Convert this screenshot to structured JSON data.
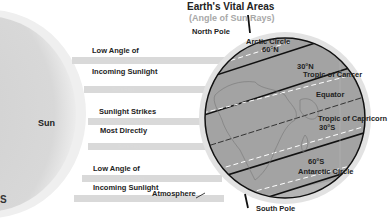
{
  "header": {
    "title": "Earth's Vital Areas",
    "subtitle": "(Angle of Sun Rays)"
  },
  "sun": {
    "label": "Sun",
    "color": "#d4d4d4"
  },
  "rays": {
    "ray_label": "Sun's Rays",
    "color": "#d9d9d9"
  },
  "left_labels": {
    "top_line1": "Low Angle of",
    "top_line2": "Incoming Sunlight",
    "mid_line1": "Sunlight Strikes",
    "mid_line2": "Most Directly",
    "bottom_line1": "Low Angle of",
    "bottom_line2": "Incoming Sunlight"
  },
  "earth_labels": {
    "north_pole": "North Pole",
    "arctic_circle": "Arctic Circle",
    "lat_60n": "60°N",
    "lat_30n": "30°N",
    "tropic_cancer": "Tropic of Cancer",
    "equator": "Equator",
    "tropic_capricorn": "Tropic of Capricorn",
    "lat_30s": "30°S",
    "lat_60s": "60°S",
    "antarctic_circle": "Antarctic Circle",
    "atmosphere": "Atmosphere",
    "south_pole": "South Pole"
  },
  "edge_fragment": "S",
  "colors": {
    "earth": "#a3a3a3",
    "atmosphere": "#dedede",
    "lines": "#111111",
    "dashed": "#ffffff"
  }
}
